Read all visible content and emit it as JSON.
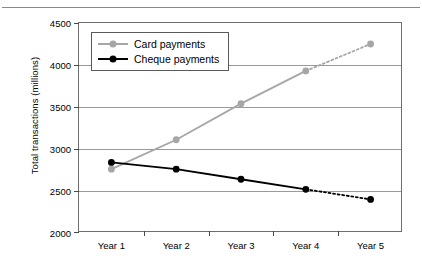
{
  "chart_data": {
    "type": "line",
    "title": "",
    "xlabel": "",
    "ylabel": "Total transactions (millions)",
    "categories": [
      "Year 1",
      "Year 2",
      "Year 3",
      "Year 4",
      "Year 5"
    ],
    "ylim": [
      2000,
      4500
    ],
    "yticks": [
      2000,
      2500,
      3000,
      3500,
      4000,
      4500
    ],
    "ytick_labels": [
      "2000",
      "2500",
      "3000",
      "3500",
      "4000",
      "4500"
    ],
    "grid": true,
    "legend_position": "upper left",
    "forecast_from_index": 3,
    "forecast_note": "segment from Year 4 to Year 5 drawn dotted for both series",
    "series": [
      {
        "name": "Card payments",
        "color": "#a6a6a6",
        "marker": "circle",
        "values": [
          2760,
          3110,
          3540,
          3930,
          4250
        ]
      },
      {
        "name": "Cheque payments",
        "color": "#000000",
        "marker": "circle",
        "values": [
          2840,
          2760,
          2640,
          2520,
          2400
        ]
      }
    ]
  }
}
